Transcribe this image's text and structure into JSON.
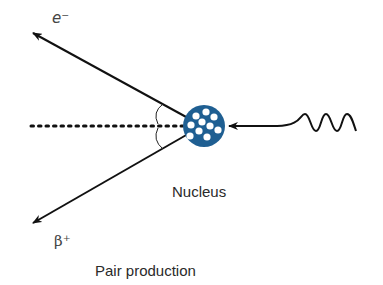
{
  "diagram": {
    "title": "Pair production",
    "labels": {
      "electron": "e⁻",
      "positron": "β⁺",
      "nucleus": "Nucleus",
      "caption": "Pair production"
    },
    "elements": {
      "incoming_photon": "wavy line arrow toward nucleus from right",
      "nucleus": "blue circle with white nucleons",
      "electron_track": "arrow to upper-left",
      "positron_track": "arrow to lower-left",
      "reference_line": "dotted horizontal line",
      "angle_marks": "two arcs between tracks and reference line"
    },
    "colors": {
      "nucleus": "#1f5f92",
      "line": "#111111",
      "text": "#333333"
    }
  }
}
